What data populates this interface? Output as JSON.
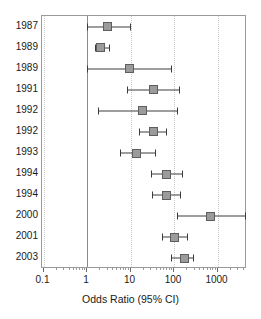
{
  "chart_data": {
    "type": "scatter",
    "subtype": "forest-plot",
    "title": "",
    "xlabel": "Odds Ratio (95% CI)",
    "ylabel": "",
    "xscale": "log",
    "xlim": [
      0.1,
      5000
    ],
    "grid": "vertical-dotted-at-decades",
    "reference_line": 1,
    "legend": "none",
    "xticks": [
      {
        "value": 0.1,
        "label": "0.1"
      },
      {
        "value": 1,
        "label": "1"
      },
      {
        "value": 10,
        "label": "10"
      },
      {
        "value": 100,
        "label": "100"
      },
      {
        "value": 1000,
        "label": "1000"
      }
    ],
    "categories": [
      "1987",
      "1989",
      "1989",
      "1991",
      "1992",
      "1992",
      "1993",
      "1994",
      "1994",
      "2000",
      "2001",
      "2003"
    ],
    "series": [
      {
        "name": "Odds Ratio (95% CI)",
        "marker": "square",
        "marker_color": "#9b9b9b",
        "marker_edge_color": "#5e5e5e",
        "line_color": "#3c3c3c",
        "points": [
          {
            "category": "1987",
            "estimate": 2.9,
            "ci_low": 1.0,
            "ci_high": 9.6
          },
          {
            "category": "1989",
            "estimate": 2.0,
            "ci_low": 1.5,
            "ci_high": 3.2
          },
          {
            "category": "1989",
            "estimate": 9.5,
            "ci_low": 1.0,
            "ci_high": 87
          },
          {
            "category": "1991",
            "estimate": 33,
            "ci_low": 8.1,
            "ci_high": 130
          },
          {
            "category": "1992",
            "estimate": 19,
            "ci_low": 1.8,
            "ci_high": 120
          },
          {
            "category": "1992",
            "estimate": 33,
            "ci_low": 16,
            "ci_high": 65
          },
          {
            "category": "1993",
            "estimate": 14,
            "ci_low": 5.6,
            "ci_high": 37
          },
          {
            "category": "1994",
            "estimate": 66,
            "ci_low": 29,
            "ci_high": 150
          },
          {
            "category": "1994",
            "estimate": 66,
            "ci_low": 32,
            "ci_high": 140
          },
          {
            "category": "2000",
            "estimate": 700,
            "ci_low": 120,
            "ci_high": 4400
          },
          {
            "category": "2001",
            "estimate": 100,
            "ci_low": 52,
            "ci_high": 200
          },
          {
            "category": "2003",
            "estimate": 170,
            "ci_low": 85,
            "ci_high": 280
          }
        ]
      }
    ]
  },
  "colors": {
    "marker_fill": "#9b9b9b",
    "marker_edge": "#5e5e5e",
    "ci_line": "#3c3c3c",
    "grid": "#c9c9c9",
    "reference_line": "#8a8a8a",
    "frame": "#9a9a9a",
    "text": "#1a1a1a",
    "background": "#ffffff"
  }
}
